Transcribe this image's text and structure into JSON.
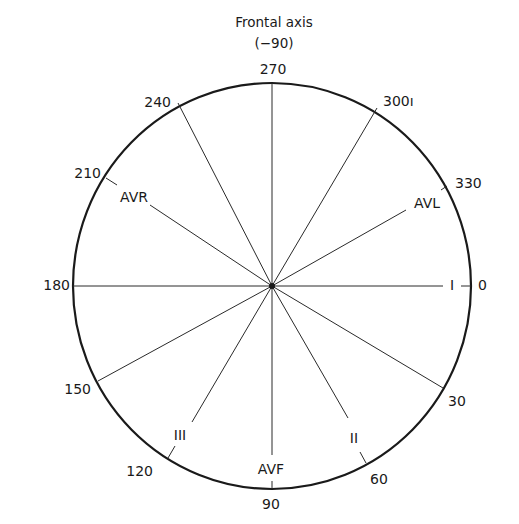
{
  "title": {
    "line1": "Frontal axis",
    "line2": "(−90)"
  },
  "colors": {
    "ink": "#1a1a1a",
    "background": "#ffffff"
  },
  "circle": {
    "cx": 272,
    "cy": 286,
    "rx": 199,
    "ry": 203
  },
  "degree_labels": [
    {
      "value": "270",
      "angle": 270
    },
    {
      "value": "300ı",
      "angle": 300
    },
    {
      "value": "330",
      "angle": 330
    },
    {
      "value": "0",
      "angle": 0
    },
    {
      "value": "30",
      "angle": 30
    },
    {
      "value": "60",
      "angle": 60
    },
    {
      "value": "90",
      "angle": 90
    },
    {
      "value": "120",
      "angle": 120
    },
    {
      "value": "150",
      "angle": 150
    },
    {
      "value": "180",
      "angle": 180
    },
    {
      "value": "210",
      "angle": 210
    },
    {
      "value": "240",
      "angle": 240
    }
  ],
  "leads": [
    {
      "name": "I",
      "angle": 0
    },
    {
      "name": "II",
      "angle": 60
    },
    {
      "name": "AVF",
      "angle": 90
    },
    {
      "name": "III",
      "angle": 120
    },
    {
      "name": "AVR",
      "angle": 210
    },
    {
      "name": "AVL",
      "angle": 330
    }
  ]
}
